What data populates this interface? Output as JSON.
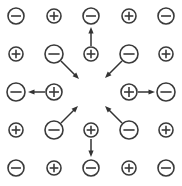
{
  "figure": {
    "width": 182,
    "height": 186,
    "background_color": "#ffffff",
    "stroke_color": "#3a3a3a",
    "arrow_color": "#333333"
  },
  "legend": {
    "positive_symbol": "+",
    "negative_symbol": "-",
    "positive_name": "positive-charge",
    "negative_name": "negative-charge"
  },
  "chart_data": {
    "type": "scatter",
    "xlabel": "",
    "ylabel": "",
    "xlim": [
      0,
      182
    ],
    "ylim": [
      0,
      186
    ],
    "grid": false,
    "legend_position": "none",
    "grid_columns_x": [
      16,
      54,
      91,
      129,
      166
    ],
    "grid_rows_y": [
      16,
      54,
      92,
      130,
      168
    ],
    "charges": [
      {
        "id": "r0c0",
        "row": 0,
        "col": 0,
        "sign": "-",
        "symbol": "-",
        "x": 16,
        "y": 16,
        "r": 8,
        "ring": "outer",
        "has_arrow": false
      },
      {
        "id": "r0c1",
        "row": 0,
        "col": 1,
        "sign": "+",
        "symbol": "+",
        "x": 54,
        "y": 16,
        "r": 7,
        "ring": "outer",
        "has_arrow": false
      },
      {
        "id": "r0c2",
        "row": 0,
        "col": 2,
        "sign": "-",
        "symbol": "-",
        "x": 91,
        "y": 16,
        "r": 8,
        "ring": "outer",
        "has_arrow": false
      },
      {
        "id": "r0c3",
        "row": 0,
        "col": 3,
        "sign": "+",
        "symbol": "+",
        "x": 129,
        "y": 16,
        "r": 7,
        "ring": "outer",
        "has_arrow": false
      },
      {
        "id": "r0c4",
        "row": 0,
        "col": 4,
        "sign": "-",
        "symbol": "-",
        "x": 166,
        "y": 16,
        "r": 8,
        "ring": "outer",
        "has_arrow": false
      },
      {
        "id": "r1c0",
        "row": 1,
        "col": 0,
        "sign": "+",
        "symbol": "+",
        "x": 16,
        "y": 54,
        "r": 7,
        "ring": "outer",
        "has_arrow": false
      },
      {
        "id": "r1c1",
        "row": 1,
        "col": 1,
        "sign": "-",
        "symbol": "-",
        "x": 54,
        "y": 54,
        "r": 9,
        "ring": "inner",
        "has_arrow": true,
        "arrow_direction": "down-right",
        "arrow": {
          "x1": 61,
          "y1": 61,
          "x2": 79,
          "y2": 79
        }
      },
      {
        "id": "r1c2",
        "row": 1,
        "col": 2,
        "sign": "+",
        "symbol": "+",
        "x": 91,
        "y": 54,
        "r": 7,
        "ring": "inner",
        "has_arrow": true,
        "arrow_direction": "up",
        "arrow": {
          "x1": 91,
          "y1": 46,
          "x2": 91,
          "y2": 27
        }
      },
      {
        "id": "r1c3",
        "row": 1,
        "col": 3,
        "sign": "-",
        "symbol": "-",
        "x": 129,
        "y": 54,
        "r": 9,
        "ring": "inner",
        "has_arrow": true,
        "arrow_direction": "down-left",
        "arrow": {
          "x1": 122,
          "y1": 61,
          "x2": 105,
          "y2": 78
        }
      },
      {
        "id": "r1c4",
        "row": 1,
        "col": 4,
        "sign": "+",
        "symbol": "+",
        "x": 166,
        "y": 54,
        "r": 7,
        "ring": "outer",
        "has_arrow": false
      },
      {
        "id": "r2c0",
        "row": 2,
        "col": 0,
        "sign": "-",
        "symbol": "-",
        "x": 16,
        "y": 92,
        "r": 9,
        "ring": "outer",
        "has_arrow": false
      },
      {
        "id": "r2c1",
        "row": 2,
        "col": 1,
        "sign": "+",
        "symbol": "+",
        "x": 54,
        "y": 92,
        "r": 8,
        "ring": "inner",
        "has_arrow": true,
        "arrow_direction": "left",
        "arrow": {
          "x1": 45,
          "y1": 92,
          "x2": 28,
          "y2": 92
        }
      },
      {
        "id": "r2c3",
        "row": 2,
        "col": 3,
        "sign": "+",
        "symbol": "+",
        "x": 129,
        "y": 92,
        "r": 8,
        "ring": "inner",
        "has_arrow": true,
        "arrow_direction": "right",
        "arrow": {
          "x1": 138,
          "y1": 92,
          "x2": 155,
          "y2": 92
        }
      },
      {
        "id": "r2c4",
        "row": 2,
        "col": 4,
        "sign": "-",
        "symbol": "-",
        "x": 166,
        "y": 92,
        "r": 9,
        "ring": "outer",
        "has_arrow": false
      },
      {
        "id": "r3c0",
        "row": 3,
        "col": 0,
        "sign": "+",
        "symbol": "+",
        "x": 16,
        "y": 130,
        "r": 7,
        "ring": "outer",
        "has_arrow": false
      },
      {
        "id": "r3c1",
        "row": 3,
        "col": 1,
        "sign": "-",
        "symbol": "-",
        "x": 54,
        "y": 130,
        "r": 9,
        "ring": "inner",
        "has_arrow": true,
        "arrow_direction": "up-right",
        "arrow": {
          "x1": 61,
          "y1": 123,
          "x2": 78,
          "y2": 106
        }
      },
      {
        "id": "r3c2",
        "row": 3,
        "col": 2,
        "sign": "+",
        "symbol": "+",
        "x": 91,
        "y": 130,
        "r": 7,
        "ring": "inner",
        "has_arrow": true,
        "arrow_direction": "down",
        "arrow": {
          "x1": 91,
          "y1": 139,
          "x2": 91,
          "y2": 157
        }
      },
      {
        "id": "r3c3",
        "row": 3,
        "col": 3,
        "sign": "-",
        "symbol": "-",
        "x": 129,
        "y": 130,
        "r": 9,
        "ring": "inner",
        "has_arrow": true,
        "arrow_direction": "up-left",
        "arrow": {
          "x1": 122,
          "y1": 123,
          "x2": 105,
          "y2": 106
        }
      },
      {
        "id": "r3c4",
        "row": 3,
        "col": 4,
        "sign": "+",
        "symbol": "+",
        "x": 166,
        "y": 130,
        "r": 7,
        "ring": "outer",
        "has_arrow": false
      },
      {
        "id": "r4c0",
        "row": 4,
        "col": 0,
        "sign": "-",
        "symbol": "-",
        "x": 16,
        "y": 168,
        "r": 8,
        "ring": "outer",
        "has_arrow": false
      },
      {
        "id": "r4c1",
        "row": 4,
        "col": 1,
        "sign": "+",
        "symbol": "+",
        "x": 54,
        "y": 168,
        "r": 7,
        "ring": "outer",
        "has_arrow": false
      },
      {
        "id": "r4c2",
        "row": 4,
        "col": 2,
        "sign": "-",
        "symbol": "-",
        "x": 91,
        "y": 168,
        "r": 8,
        "ring": "outer",
        "has_arrow": false
      },
      {
        "id": "r4c3",
        "row": 4,
        "col": 3,
        "sign": "+",
        "symbol": "+",
        "x": 129,
        "y": 168,
        "r": 7,
        "ring": "outer",
        "has_arrow": false
      },
      {
        "id": "r4c4",
        "row": 4,
        "col": 4,
        "sign": "-",
        "symbol": "-",
        "x": 166,
        "y": 168,
        "r": 8,
        "ring": "outer",
        "has_arrow": false
      }
    ]
  }
}
